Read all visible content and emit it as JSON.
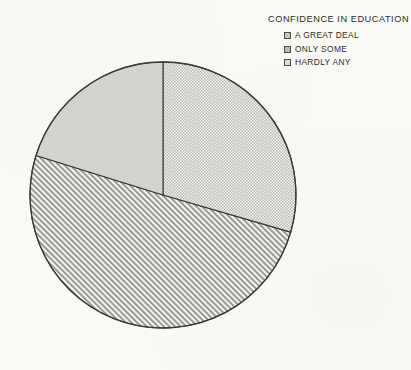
{
  "legend": {
    "title": "CONFIDENCE IN EDUCATION",
    "items": [
      {
        "label": "A GREAT DEAL",
        "pattern": "dots",
        "swatch_name": "legend-swatch-a-great-deal"
      },
      {
        "label": "ONLY SOME",
        "pattern": "diagonal-hatch",
        "swatch_name": "legend-swatch-only-some"
      },
      {
        "label": "HARDLY ANY",
        "pattern": "solid-gray",
        "swatch_name": "legend-swatch-hardly-any"
      }
    ]
  },
  "colors": {
    "background": "#fbfaf5",
    "outline": "#3a3a3a",
    "solid_gray_fill": "#d2d0cb",
    "pattern_ink": "#6e6c68",
    "pattern_base": "#f2f1ec",
    "text": "#2c2c2c"
  },
  "chart_data": {
    "type": "pie",
    "title": "CONFIDENCE IN EDUCATION",
    "xlabel": "",
    "ylabel": "",
    "legend_position": "top-right",
    "grid": false,
    "start_angle_deg": 0,
    "direction": "clockwise",
    "center": {
      "x": 163,
      "y": 195
    },
    "radius": 133,
    "labels": [
      "A GREAT DEAL",
      "ONLY SOME",
      "HARDLY ANY"
    ],
    "values": [
      29.5,
      50.3,
      20.2
    ],
    "units": "percent",
    "slices": [
      {
        "label": "A GREAT DEAL",
        "value": 29.5,
        "start_angle_deg": 0,
        "end_angle_deg": 106.2,
        "pattern": "dots",
        "name": "pie-slice-a-great-deal"
      },
      {
        "label": "ONLY SOME",
        "value": 50.3,
        "start_angle_deg": 106.2,
        "end_angle_deg": 287.3,
        "pattern": "diagonal-hatch",
        "name": "pie-slice-only-some"
      },
      {
        "label": "HARDLY ANY",
        "value": 20.2,
        "start_angle_deg": 287.3,
        "end_angle_deg": 360,
        "pattern": "solid-gray",
        "name": "pie-slice-hardly-any"
      }
    ]
  }
}
